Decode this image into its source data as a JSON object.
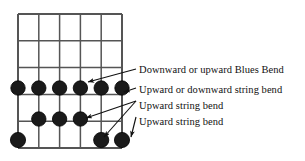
{
  "figure": {
    "type": "guitar-fretboard-chord-diagram",
    "background_color": "#ffffff",
    "ink_color": "#111111",
    "grid_color": "#555555",
    "dot_color": "#1a1a1a"
  },
  "fretboard": {
    "strings": 6,
    "frets": 5,
    "left": 18,
    "top": 14,
    "right": 122,
    "bottom": 148,
    "string_x": [
      18,
      38.8,
      59.6,
      80.4,
      101.2,
      122
    ],
    "fret_y": [
      14,
      40.8,
      67.6,
      94.4,
      121.2,
      148
    ],
    "nut_present": false
  },
  "dots": [
    {
      "id": "dot-r1-s1",
      "x": 18,
      "y": 88,
      "r": 7.2,
      "row": 1,
      "string": 1
    },
    {
      "id": "dot-r1-s2",
      "x": 38.8,
      "y": 88,
      "r": 7.2,
      "row": 1,
      "string": 2
    },
    {
      "id": "dot-r1-s3",
      "x": 59.6,
      "y": 88,
      "r": 7.2,
      "row": 1,
      "string": 3
    },
    {
      "id": "dot-r1-s4",
      "x": 80.4,
      "y": 88,
      "r": 7.2,
      "row": 1,
      "string": 4
    },
    {
      "id": "dot-r1-s5",
      "x": 101.2,
      "y": 88,
      "r": 7.2,
      "row": 1,
      "string": 5
    },
    {
      "id": "dot-r1-s6",
      "x": 122,
      "y": 88,
      "r": 7.2,
      "row": 1,
      "string": 6
    },
    {
      "id": "dot-r2-s2",
      "x": 38.8,
      "y": 119,
      "r": 7.2,
      "row": 2,
      "string": 2
    },
    {
      "id": "dot-r2-s3",
      "x": 59.6,
      "y": 119,
      "r": 7.2,
      "row": 2,
      "string": 3
    },
    {
      "id": "dot-r2-s4",
      "x": 80.4,
      "y": 119,
      "r": 7.2,
      "row": 2,
      "string": 4
    },
    {
      "id": "dot-r3-s1",
      "x": 18,
      "y": 140,
      "r": 7.6,
      "row": 3,
      "string": 1
    },
    {
      "id": "dot-r3-s5",
      "x": 101.2,
      "y": 140,
      "r": 7.6,
      "row": 3,
      "string": 5
    },
    {
      "id": "dot-r3-s6",
      "x": 122,
      "y": 140,
      "r": 7.6,
      "row": 3,
      "string": 6
    }
  ],
  "annotations": [
    {
      "id": "annotation-blues-bend",
      "label": "Downward or upward Blues Bend",
      "text_x": 139,
      "text_y": 64,
      "leader": {
        "x1": 136,
        "y1": 69,
        "x2": 88,
        "y2": 82
      },
      "arrow_target": "dot-r1-s4"
    },
    {
      "id": "annotation-updown-string-bend",
      "label": "Upward or downward string bend",
      "text_x": 139,
      "text_y": 84,
      "leader": {
        "x1": 136,
        "y1": 88,
        "x2": 124,
        "y2": 92
      },
      "arrow_target": "dot-r1-s6"
    },
    {
      "id": "annotation-upward-string-bend-1",
      "label": "Upward string bend",
      "text_x": 139,
      "text_y": 100,
      "leader": {
        "x1": 136,
        "y1": 101,
        "x2": 86,
        "y2": 118
      },
      "arrow_target": "dot-r2-s4"
    },
    {
      "id": "annotation-upward-string-bend-2",
      "label": "Upward string bend",
      "text_x": 139,
      "text_y": 116,
      "leader": {
        "x1": 136,
        "y1": 117,
        "x2": 131,
        "y2": 137
      },
      "arrow_target": "dot-r3-s6"
    }
  ],
  "extra_leaders": [
    {
      "id": "leader-to-r3-s5",
      "x1": 136,
      "y1": 101,
      "x2": 104,
      "y2": 137,
      "arrow_target": "dot-r3-s5"
    }
  ]
}
